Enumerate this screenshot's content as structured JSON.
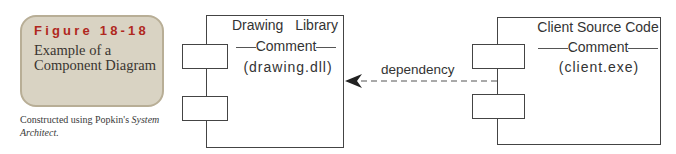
{
  "figure": {
    "number_label": "Figure 18-18",
    "title": "Example of a Component Diagram",
    "caption_prefix": "Constructed using Popkin's ",
    "caption_italic": "System Architect.",
    "colors": {
      "label_red": "#b0281e",
      "box_bg": "#d9d3c3",
      "box_border": "#b8ae96"
    }
  },
  "diagram": {
    "components": [
      {
        "name": "Drawing Library",
        "stereotype": "Comment",
        "artifact": "(drawing.dll)"
      },
      {
        "name": "Client Source Code",
        "stereotype": "Comment",
        "artifact": "(client.exe)"
      }
    ],
    "relationship": {
      "type": "dependency",
      "label": "dependency",
      "from": "Client Source Code",
      "to": "Drawing Library"
    }
  }
}
